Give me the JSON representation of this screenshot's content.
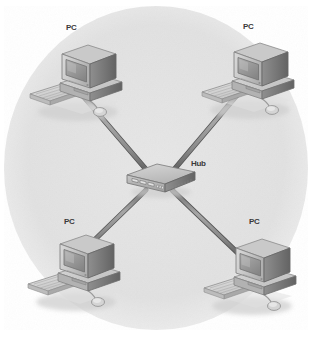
{
  "figure": {
    "kind": "network-topology-diagram",
    "topology": "star",
    "background_shape": "ellipse",
    "colors": {
      "page_background": "#ffffff",
      "ellipse_fill": "#e2e2e2",
      "cable": "#8d8d8d",
      "cable_shade": "#5f5f5f",
      "device_light": "#d2d2d2",
      "device_mid": "#a8a8a8",
      "device_dark": "#6e6e6e",
      "screen": "#9a9a9a",
      "label_text": "#3a3a3a",
      "shadow": "#c8c8c8"
    }
  },
  "nodes": [
    {
      "id": "pc-top-left",
      "label": "PC",
      "type": "workstation",
      "x": 74,
      "y": 72
    },
    {
      "id": "pc-top-right",
      "label": "PC",
      "type": "workstation",
      "x": 246,
      "y": 70
    },
    {
      "id": "pc-bottom-left",
      "label": "PC",
      "type": "workstation",
      "x": 72,
      "y": 262
    },
    {
      "id": "pc-bottom-right",
      "label": "PC",
      "type": "workstation",
      "x": 248,
      "y": 266
    },
    {
      "id": "hub-center",
      "label": "Hub",
      "type": "hub",
      "x": 160,
      "y": 179
    }
  ],
  "labels": {
    "pc_top_left": {
      "text": "PC",
      "x": 66,
      "y": 24
    },
    "pc_top_right": {
      "text": "PC",
      "x": 243,
      "y": 23
    },
    "pc_bottom_left": {
      "text": "PC",
      "x": 64,
      "y": 218
    },
    "pc_bottom_right": {
      "text": "PC",
      "x": 249,
      "y": 218
    },
    "hub": {
      "text": "Hub",
      "x": 191,
      "y": 160
    }
  },
  "links": [
    {
      "id": "link-hub-pc-top-left",
      "from": "hub-center",
      "to": "pc-top-left",
      "style": "cable"
    },
    {
      "id": "link-hub-pc-top-right",
      "from": "hub-center",
      "to": "pc-top-right",
      "style": "cable"
    },
    {
      "id": "link-hub-pc-bottom-left",
      "from": "hub-center",
      "to": "pc-bottom-left",
      "style": "cable"
    },
    {
      "id": "link-hub-pc-bottom-right",
      "from": "hub-center",
      "to": "pc-bottom-right",
      "style": "cable"
    }
  ]
}
